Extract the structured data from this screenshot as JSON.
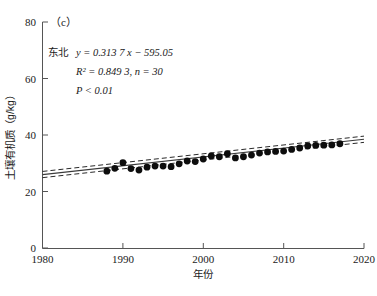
{
  "chart_data": {
    "type": "scatter",
    "title": "",
    "panel_label": "（c）",
    "xlabel": "年份",
    "ylabel": "土壤有机质（g/kg）",
    "xlim": [
      1980,
      2020
    ],
    "ylim": [
      0,
      80
    ],
    "xticks": [
      1980,
      1990,
      2000,
      2010,
      2020
    ],
    "xtick_labels": [
      "1980",
      "1990",
      "2000",
      "2010",
      "2020"
    ],
    "yticks": [
      0,
      20,
      40,
      60,
      80
    ],
    "ytick_labels": [
      "0",
      "20",
      "40",
      "60",
      "80"
    ],
    "grid": false,
    "legend": null,
    "region_label": "东北",
    "equation": "y = 0.313 7 x − 595.05",
    "r2_text": "R² = 0.849 3, n = 30",
    "p_text": "P < 0.01",
    "slope": 0.3137,
    "intercept": -595.05,
    "r_squared": 0.8493,
    "n": 30,
    "p_value": "< 0.01",
    "series": [
      {
        "name": "东北 土壤有机质",
        "marker": "filled-circle",
        "color": "#0d0d0d",
        "x": [
          1988,
          1989,
          1990,
          1991,
          1992,
          1993,
          1994,
          1995,
          1996,
          1997,
          1998,
          1999,
          2000,
          2001,
          2002,
          2003,
          2004,
          2005,
          2006,
          2007,
          2008,
          2009,
          2010,
          2011,
          2012,
          2013,
          2014,
          2015,
          2016,
          2017
        ],
        "y": [
          27.2,
          28.2,
          30.2,
          28.1,
          27.6,
          28.6,
          29.0,
          29.0,
          28.8,
          29.8,
          30.8,
          30.6,
          31.5,
          32.6,
          32.3,
          33.4,
          31.9,
          32.3,
          32.9,
          33.6,
          34.0,
          34.2,
          34.3,
          34.9,
          35.4,
          36.1,
          36.3,
          36.4,
          36.5,
          36.9
        ]
      }
    ],
    "fit_line": {
      "style": "solid",
      "x": [
        1980,
        2020
      ],
      "y": [
        26.0,
        38.5
      ]
    },
    "confidence_bands": [
      {
        "style": "dashed",
        "offset": 1.1
      },
      {
        "style": "dashed",
        "offset": -1.1
      }
    ]
  }
}
